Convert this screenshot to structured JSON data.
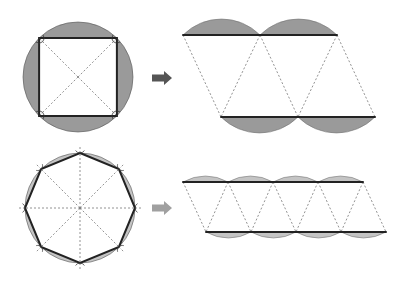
{
  "colors": {
    "segment_dark": "#9a9a9a",
    "segment_light": "#c4c4c4",
    "outline": "#222222",
    "dashed": "#777777",
    "arrow_top": "#555555",
    "arrow_bottom": "#a0a0a0"
  },
  "figures": [
    {
      "id": "square",
      "polygon_sides": 4,
      "description": "Circle with inscribed square; segments shaded",
      "rearranged_segments_top": 2,
      "rearranged_segments_bottom": 2,
      "shade": "dark"
    },
    {
      "id": "octagon",
      "polygon_sides": 8,
      "description": "Circle with inscribed octagon; segments shaded",
      "rearranged_segments_top": 4,
      "rearranged_segments_bottom": 4,
      "shade": "light"
    }
  ],
  "icons": {
    "arrow": "right-arrow"
  }
}
